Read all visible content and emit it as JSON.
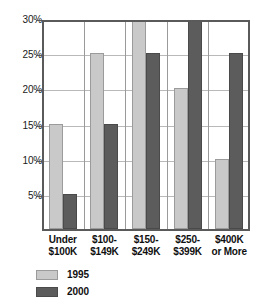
{
  "chart_data": {
    "type": "bar",
    "title": "",
    "subtitle": "",
    "xlabel": "",
    "ylabel": "",
    "grid": true,
    "legend_position": "bottom-left",
    "ylim": [
      0,
      30
    ],
    "ytick_labels": [
      "30%",
      "25%",
      "20%",
      "15%",
      "10%",
      "5%"
    ],
    "ytick_values": [
      30,
      25,
      20,
      15,
      10,
      5
    ],
    "categories": [
      "Under $100K",
      "$100-$149K",
      "$150-$249K",
      "$250-$399K",
      "$400K or More"
    ],
    "category_lines": [
      [
        "Under",
        "$100K"
      ],
      [
        "$100-",
        "$149K"
      ],
      [
        "$150-",
        "$249K"
      ],
      [
        "$250-",
        "$399K"
      ],
      [
        "$400K",
        "or More"
      ]
    ],
    "series": [
      {
        "name": "1995",
        "color": "#c9c9c9",
        "values": [
          15,
          25,
          30,
          20,
          10
        ],
        "clipped": [
          false,
          false,
          true,
          false,
          false
        ]
      },
      {
        "name": "2000",
        "color": "#5c5c5c",
        "values": [
          5,
          15,
          25,
          30,
          25
        ],
        "clipped": [
          false,
          false,
          false,
          true,
          false
        ]
      }
    ]
  },
  "legend": {
    "items": [
      {
        "label": "1995",
        "swatch": "#c9c9c9"
      },
      {
        "label": "2000",
        "swatch": "#5c5c5c"
      }
    ]
  },
  "axis": {
    "y": {
      "ticks": [
        {
          "label": "30%",
          "value": 30
        },
        {
          "label": "25%",
          "value": 25
        },
        {
          "label": "20%",
          "value": 20
        },
        {
          "label": "15%",
          "value": 15
        },
        {
          "label": "10%",
          "value": 10
        },
        {
          "label": "5%",
          "value": 5
        }
      ]
    }
  }
}
